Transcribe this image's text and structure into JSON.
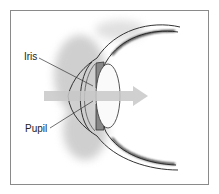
{
  "diagram": {
    "labels": [
      {
        "text": "Iris"
      },
      {
        "text": "Pupil"
      }
    ],
    "colors": {
      "border": "#8a8a8a",
      "arrow": "#c8c8c8",
      "outline": "#333333",
      "shading": "#9a9a9a"
    }
  }
}
